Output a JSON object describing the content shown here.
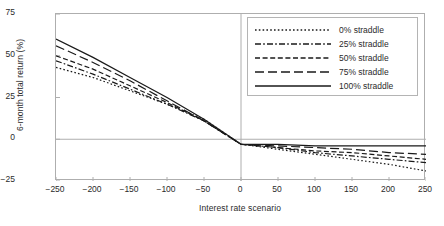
{
  "chart_data": {
    "type": "line",
    "title": "",
    "xlabel": "Interest rate scenario",
    "ylabel": "6-month total return (%)",
    "xlim": [
      -250,
      250
    ],
    "ylim": [
      -25,
      75
    ],
    "xticks": [
      -250,
      -200,
      -150,
      -100,
      -50,
      0,
      50,
      100,
      150,
      200,
      250
    ],
    "xticklabels": [
      "−250",
      "−200",
      "−150",
      "−100",
      "−50",
      "0",
      "50",
      "100",
      "150",
      "200",
      "250"
    ],
    "yticks": [
      -25,
      0,
      25,
      50,
      75
    ],
    "yticklabels": [
      "−25",
      "0",
      "25",
      "50",
      "75"
    ],
    "grid": false,
    "zero_lines": true,
    "legend_position": "upper right",
    "x": [
      -250,
      -200,
      -150,
      -100,
      -50,
      0,
      50,
      100,
      150,
      200,
      250
    ],
    "series": [
      {
        "name": "0% straddle",
        "dash": "dotted",
        "values": [
          43,
          37,
          29,
          21,
          12,
          -3,
          -6,
          -9,
          -12,
          -15,
          -19
        ]
      },
      {
        "name": "25% straddle",
        "dash": "dash-dot",
        "values": [
          47,
          39,
          30,
          21,
          11,
          -3,
          -5,
          -8,
          -10,
          -12,
          -14
        ]
      },
      {
        "name": "50% straddle",
        "dash": "dashed-short",
        "values": [
          50,
          42,
          32,
          22,
          11,
          -3,
          -5,
          -7,
          -8,
          -10,
          -12
        ]
      },
      {
        "name": "75% straddle",
        "dash": "dashed-long",
        "values": [
          56,
          46,
          35,
          23,
          11,
          -3,
          -4,
          -5,
          -6,
          -8,
          -9
        ]
      },
      {
        "name": "100% straddle",
        "dash": "solid",
        "values": [
          60,
          49,
          37,
          25,
          12,
          -3,
          -3,
          -4,
          -4,
          -4,
          -4
        ]
      }
    ]
  },
  "legend": {
    "items": [
      {
        "label": "0% straddle"
      },
      {
        "label": "25% straddle"
      },
      {
        "label": "50% straddle"
      },
      {
        "label": "75% straddle"
      },
      {
        "label": "100% straddle"
      }
    ]
  },
  "colors": {
    "line": "#1a1a1a",
    "axis": "#aeaeae",
    "text": "#2b2b2b",
    "background": "#ffffff"
  }
}
